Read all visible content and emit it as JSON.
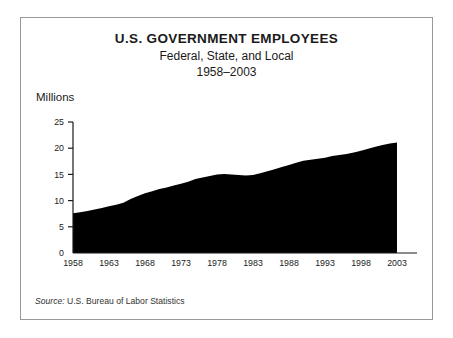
{
  "figure": {
    "title": "U.S. GOVERNMENT EMPLOYEES",
    "subtitle": "Federal, State, and Local",
    "period": "1958–2003",
    "y_axis_title": "Millions",
    "source_label": "Source:",
    "source_text": " U.S. Bureau of Labor Statistics",
    "border_color": "#999999",
    "fill_color": "#000000",
    "text_color": "#1a1a1a"
  },
  "chart_data": {
    "type": "area",
    "title": "U.S. GOVERNMENT EMPLOYEES",
    "subtitle": "Federal, State, and Local",
    "xlabel": "",
    "ylabel": "Millions",
    "xlim": [
      1958,
      2003
    ],
    "ylim": [
      0,
      25
    ],
    "grid": false,
    "legend": "none",
    "fill_color": "#000000",
    "x_tick_labels": [
      "1958",
      "1963",
      "1968",
      "1973",
      "1978",
      "1983",
      "1988",
      "1993",
      "1998",
      "2003"
    ],
    "x_ticks": [
      1958,
      1963,
      1968,
      1973,
      1978,
      1983,
      1988,
      1993,
      1998,
      2003
    ],
    "y_tick_labels": [
      "0",
      "5",
      "10",
      "15",
      "20",
      "25"
    ],
    "y_ticks": [
      0,
      5,
      10,
      15,
      20,
      25
    ],
    "x": [
      1958,
      1959,
      1960,
      1961,
      1962,
      1963,
      1964,
      1965,
      1966,
      1967,
      1968,
      1969,
      1970,
      1971,
      1972,
      1973,
      1974,
      1975,
      1976,
      1977,
      1978,
      1979,
      1980,
      1981,
      1982,
      1983,
      1984,
      1985,
      1986,
      1987,
      1988,
      1989,
      1990,
      1991,
      1992,
      1993,
      1994,
      1995,
      1996,
      1997,
      1998,
      1999,
      2000,
      2001,
      2002,
      2003
    ],
    "values": [
      7.6,
      7.8,
      8.0,
      8.3,
      8.6,
      8.9,
      9.2,
      9.6,
      10.3,
      10.9,
      11.4,
      11.8,
      12.2,
      12.5,
      12.9,
      13.2,
      13.6,
      14.1,
      14.4,
      14.7,
      15.0,
      15.1,
      15.0,
      14.9,
      14.8,
      14.9,
      15.2,
      15.6,
      16.0,
      16.4,
      16.8,
      17.2,
      17.6,
      17.8,
      18.0,
      18.2,
      18.5,
      18.7,
      18.9,
      19.2,
      19.5,
      19.9,
      20.3,
      20.6,
      20.9,
      21.1
    ]
  }
}
